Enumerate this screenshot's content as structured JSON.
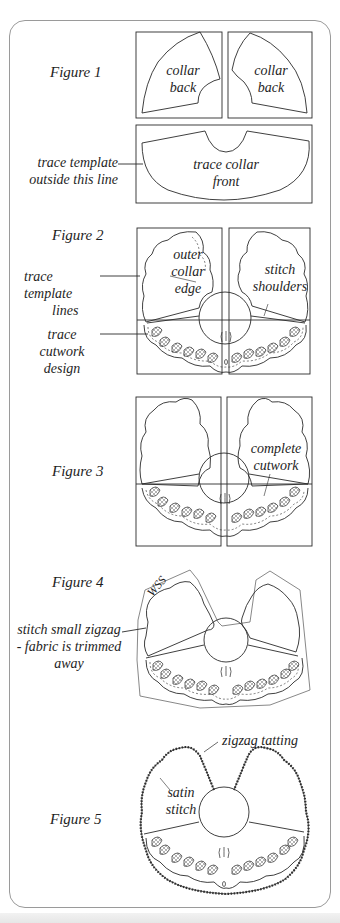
{
  "figures": [
    {
      "label": "Figure 1",
      "pieces": [
        "collar\nback",
        "collar\nback",
        "trace collar\nfront"
      ],
      "piece_lines": [
        [
          "collar",
          "back"
        ],
        [
          "collar",
          "back"
        ],
        [
          "trace collar",
          "front"
        ]
      ],
      "notes": [
        [
          "trace template",
          "outside this line"
        ]
      ]
    },
    {
      "label": "Figure 2",
      "inner_labels": [
        [
          "outer",
          "collar",
          "edge"
        ],
        [
          "stitch",
          "shoulders"
        ]
      ],
      "notes": [
        [
          "trace template",
          "lines"
        ],
        [
          "trace cutwork",
          "design"
        ]
      ]
    },
    {
      "label": "Figure 3",
      "inner_labels": [
        [
          "complete",
          "cutwork"
        ]
      ]
    },
    {
      "label": "Figure 4",
      "inner_labels": [
        [
          "WSS"
        ]
      ],
      "notes": [
        [
          "stitch small zigzag",
          "- fabric is trimmed",
          "away"
        ]
      ]
    },
    {
      "label": "Figure 5",
      "inner_labels": [
        [
          "satin",
          "stitch"
        ],
        [
          "zigzag tatting"
        ]
      ]
    }
  ],
  "colors": {
    "ink": "#2a2a2a",
    "panel_border": "#9a9a9a",
    "background": "#ffffff"
  }
}
